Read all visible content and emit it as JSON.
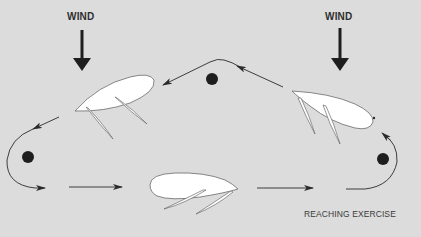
{
  "diagram": {
    "title": "REACHING EXERCISE",
    "wind_labels": [
      "WIND",
      "WIND"
    ],
    "elements": {
      "wind_arrows": 2,
      "marks": 3,
      "boats": 3,
      "path_arrows": [
        "top-leg-left",
        "left-rounding",
        "bottom-leg",
        "bottom-leg-2",
        "right-rounding"
      ]
    },
    "colors": {
      "background": "#dcdcdc",
      "ink": "#2a2a2a",
      "hull": "#ffffff",
      "mark": "#1e1e1e"
    }
  }
}
